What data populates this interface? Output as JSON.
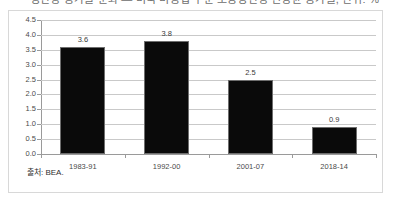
{
  "figure": {
    "title_cropped": "생산성 증가율 둔화 — 미국 비농업 부문 노동생산성 연평균 증가율, 단위: %",
    "source_note": "출처: BEA."
  },
  "chart_data": {
    "type": "bar",
    "title": "",
    "xlabel": "",
    "ylabel": "",
    "categories": [
      "1983-91",
      "1992-00",
      "2001-07",
      "2018-14"
    ],
    "values": [
      3.6,
      3.8,
      2.5,
      0.9
    ],
    "value_labels": [
      "3.6",
      "3.8",
      "2.5",
      "0.9"
    ],
    "ylim": [
      0.0,
      4.5
    ],
    "ytick_step": 0.5,
    "yticks": [
      "4.5",
      "4.0",
      "3.5",
      "3.0",
      "2.5",
      "2.0",
      "1.5",
      "1.0",
      "0.5",
      "0.0"
    ],
    "grid": true,
    "legend": false,
    "bar_color": "#0a0a0a",
    "gridline_color": "#c9c9c9",
    "axis_color": "#9a9a9a"
  }
}
